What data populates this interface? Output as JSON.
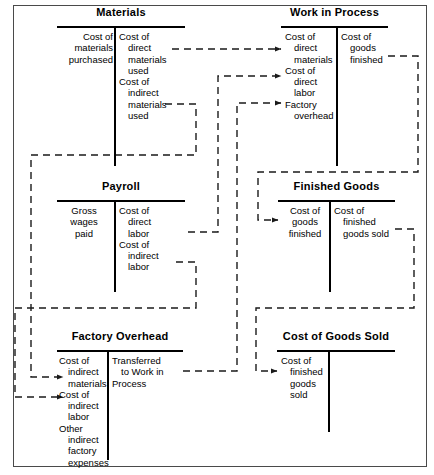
{
  "diagram": {
    "type": "t-account-flow",
    "accounts": [
      {
        "id": "materials",
        "name": "Materials",
        "debit_entries": [
          {
            "lines": [
              "Cost of",
              "materials",
              "purchased"
            ]
          }
        ],
        "credit_entries": [
          {
            "lines": [
              "Cost of",
              "direct",
              "materials",
              "used"
            ]
          },
          {
            "lines": [
              "Cost of",
              "indirect",
              "materials",
              "used"
            ]
          }
        ]
      },
      {
        "id": "work-in-process",
        "name": "Work in Process",
        "debit_entries": [
          {
            "lines": [
              "Cost of",
              "direct",
              "materials"
            ]
          },
          {
            "lines": [
              "Cost of",
              "direct",
              "labor"
            ]
          },
          {
            "lines": [
              "Factory",
              "overhead"
            ]
          }
        ],
        "credit_entries": [
          {
            "lines": [
              "Cost of",
              "goods",
              "finished"
            ]
          }
        ]
      },
      {
        "id": "payroll",
        "name": "Payroll",
        "debit_entries": [
          {
            "lines": [
              "Gross wages",
              "paid"
            ]
          }
        ],
        "credit_entries": [
          {
            "lines": [
              "Cost of",
              "direct",
              "labor"
            ]
          },
          {
            "lines": [
              "Cost of",
              "indirect",
              "labor"
            ]
          }
        ]
      },
      {
        "id": "finished-goods",
        "name": "Finished Goods",
        "debit_entries": [
          {
            "lines": [
              "Cost of",
              "goods",
              "finished"
            ]
          }
        ],
        "credit_entries": [
          {
            "lines": [
              "Cost of",
              "finished",
              "goods sold"
            ]
          }
        ]
      },
      {
        "id": "factory-overhead",
        "name": "Factory Overhead",
        "debit_entries": [
          {
            "lines": [
              "Cost of",
              "indirect",
              "materials"
            ]
          },
          {
            "lines": [
              "Cost of",
              "indirect",
              "labor"
            ]
          },
          {
            "lines": [
              "Other",
              "indirect",
              "factory",
              "expenses"
            ]
          }
        ],
        "credit_entries": [
          {
            "lines": [
              "Transferred",
              "to Work in",
              "Process"
            ]
          }
        ]
      },
      {
        "id": "cost-of-goods-sold",
        "name": "Cost of Goods Sold",
        "debit_entries": [
          {
            "lines": [
              "Cost of",
              "finished",
              "goods",
              "sold"
            ]
          }
        ],
        "credit_entries": []
      }
    ],
    "flows": [
      {
        "id": "flow-direct-materials",
        "from": "materials",
        "to": "work-in-process",
        "label": "Cost of direct materials used"
      },
      {
        "id": "flow-indirect-materials",
        "from": "materials",
        "to": "factory-overhead",
        "label": "Cost of indirect materials used"
      },
      {
        "id": "flow-direct-labor",
        "from": "payroll",
        "to": "work-in-process",
        "label": "Cost of direct labor"
      },
      {
        "id": "flow-indirect-labor",
        "from": "payroll",
        "to": "factory-overhead",
        "label": "Cost of indirect labor"
      },
      {
        "id": "flow-overhead-applied",
        "from": "factory-overhead",
        "to": "work-in-process",
        "label": "Transferred to Work in Process"
      },
      {
        "id": "flow-goods-finished",
        "from": "work-in-process",
        "to": "finished-goods",
        "label": "Cost of goods finished"
      },
      {
        "id": "flow-goods-sold",
        "from": "finished-goods",
        "to": "cost-of-goods-sold",
        "label": "Cost of finished goods sold"
      }
    ],
    "colors": {
      "ink": "#000000",
      "frame": "#4a4a4a",
      "wire": "#222222",
      "background": "#ffffff"
    }
  }
}
